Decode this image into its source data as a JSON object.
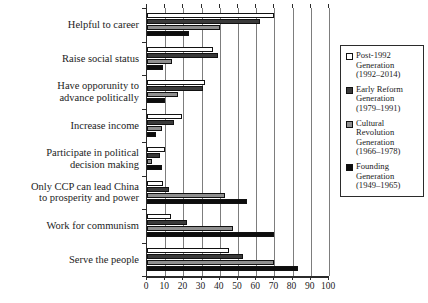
{
  "chart_data": {
    "type": "bar",
    "orientation": "horizontal",
    "title": "",
    "xlabel": "",
    "ylabel": "",
    "xlim": [
      0,
      100
    ],
    "xticks": [
      0,
      10,
      20,
      30,
      40,
      50,
      60,
      70,
      80,
      90,
      100
    ],
    "grid": true,
    "legend_position": "right",
    "categories": [
      "Helpful to career",
      "Raise social status",
      "Have opporunity to advance politically",
      "Increase income",
      "Participate in political decision making",
      "Only CCP can lead China to prosperity and power",
      "Work for communism",
      "Serve the people"
    ],
    "category_lines": [
      [
        "Helpful to career"
      ],
      [
        "Raise social status"
      ],
      [
        "Have opporunity to",
        "advance politically"
      ],
      [
        "Increase income"
      ],
      [
        "Participate in political",
        "decision making"
      ],
      [
        "Only CCP can lead China",
        "to prosperity and power"
      ],
      [
        "Work for communism"
      ],
      [
        "Serve the people"
      ]
    ],
    "series": [
      {
        "name": "Post-1992 Generation (1992–2014)",
        "color": "#ffffff",
        "values": [
          70,
          36,
          32,
          19,
          10,
          9,
          13,
          45
        ]
      },
      {
        "name": "Early Reform Generation (1979–1991)",
        "color": "#3a3a3a",
        "values": [
          62,
          39,
          31,
          15,
          7,
          12,
          22,
          53
        ]
      },
      {
        "name": "Cultural Revolution Generation (1966–1978)",
        "color": "#8f8f8f",
        "values": [
          40,
          14,
          17,
          8,
          3,
          43,
          47,
          70
        ]
      },
      {
        "name": "Founding Generation (1949–1965)",
        "color": "#0d0d0d",
        "values": [
          23,
          9,
          10,
          5,
          8,
          55,
          70,
          83
        ]
      }
    ]
  },
  "legend": {
    "items": [
      {
        "swatch": "#ffffff",
        "lines": [
          "Post-1992",
          "Generation",
          "(1992–2014)"
        ]
      },
      {
        "swatch": "#3a3a3a",
        "lines": [
          "Early Reform",
          "Generation",
          "(1979–1991)"
        ]
      },
      {
        "swatch": "#8f8f8f",
        "lines": [
          "Cultural",
          "Revolution",
          "Generation",
          "(1966–1978)"
        ]
      },
      {
        "swatch": "#0d0d0d",
        "lines": [
          "Founding",
          "Generation",
          "(1949–1965)"
        ]
      }
    ]
  }
}
